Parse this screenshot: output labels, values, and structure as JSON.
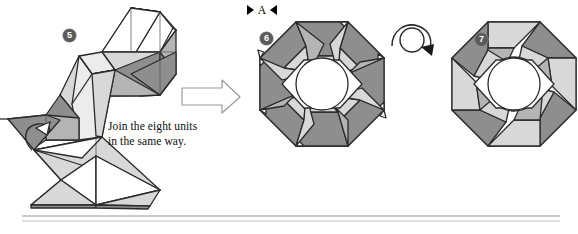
{
  "page": {
    "background": "#ffffff",
    "ink": "#1a1a1a",
    "width": 578,
    "height": 234
  },
  "palette": {
    "dark_gray": "#8e8e8e",
    "mid_gray": "#b4b4b4",
    "light_gray": "#d8d8d8",
    "pale_gray": "#eceaea",
    "white": "#ffffff",
    "outline": "#2b2b2b",
    "thin_line": "#4a4a4a",
    "badge_fill": "#5b5b5b",
    "badge_text": "#ffffff",
    "rule": "#b9b9b9"
  },
  "marker": {
    "label": "A",
    "left_arrow_icon": "triangle-right-icon",
    "right_arrow_icon": "triangle-left-icon"
  },
  "steps": [
    {
      "number": "5",
      "badge_id": "badge5",
      "name": "step-5-unit-diagram"
    },
    {
      "number": "6",
      "badge_id": "badge6",
      "name": "step-6-octagon-ring"
    },
    {
      "number": "7",
      "badge_id": "badge7",
      "name": "step-7-octagon-pinwheel"
    }
  ],
  "caption": {
    "line1": "Join the eight units",
    "line2": "in the same way."
  },
  "arrows": {
    "process_arrow": "block-arrow-right-icon",
    "turn_over_arrow": "turn-over-circular-arrow-icon",
    "tuck_arrow": "tuck-curved-arrow-icon"
  },
  "rules": {
    "count": 2,
    "x_start": 22,
    "x_end": 560,
    "y_top": 216,
    "y_bottom": 221
  }
}
